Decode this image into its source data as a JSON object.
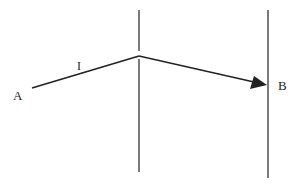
{
  "diagram": {
    "type": "ray-path between two vertical boundaries",
    "labels": {
      "start": "A",
      "end": "B",
      "segment": "I"
    },
    "colors": {
      "line": "#222222",
      "background": "#ffffff"
    },
    "geometry": {
      "left_boundary": {
        "x": 139,
        "y1": 10,
        "y2": 172
      },
      "right_boundary": {
        "x": 268,
        "y1": 10,
        "y2": 178
      },
      "path": [
        [
          32,
          88
        ],
        [
          139,
          56
        ],
        [
          267,
          85
        ]
      ],
      "arrowhead_at": [
        267,
        85
      ]
    }
  }
}
